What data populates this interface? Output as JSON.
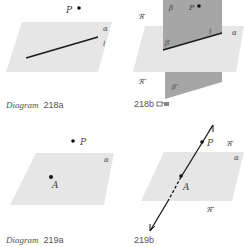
{
  "colors": {
    "plane": "#e6e6e6",
    "vertical_plane": "#a6a6a6",
    "line": "#1a1a1a",
    "text": "#555555"
  },
  "diagram_218a": {
    "caption_word": "Diagram",
    "caption_num": "218a",
    "point_label": "P",
    "plane_label": "α",
    "line_label": "l"
  },
  "diagram_218b": {
    "caption_num": "218b",
    "icon": "3d-glasses-icon",
    "point_label": "P",
    "plane_label": "α",
    "vertical_plane_label": "β",
    "line_label": "l",
    "upper_half_label": "β′",
    "lower_half_label": "β″",
    "upper_region_label": "ℜ′",
    "lower_region_label": "ℜ″"
  },
  "diagram_219a": {
    "caption_word": "Diagram",
    "caption_num": "219a",
    "point_P_label": "P",
    "point_A_label": "A",
    "plane_label": "α"
  },
  "diagram_219b": {
    "caption_num": "219b",
    "point_P_label": "P",
    "point_A_label": "A",
    "plane_label": "α",
    "upper_region_label": "ℜ′",
    "lower_region_label": "ℜ″"
  }
}
